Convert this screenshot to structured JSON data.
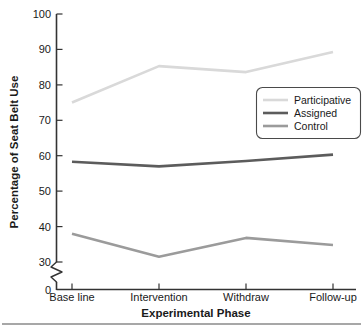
{
  "chart_data": {
    "type": "line",
    "title": "",
    "xlabel": "Experimental Phase",
    "ylabel": "Percentage of Seat Belt Use",
    "categories": [
      "Base line",
      "Intervention",
      "Withdraw",
      "Follow-up"
    ],
    "ylim": [
      30,
      100
    ],
    "yticks": [
      30,
      40,
      50,
      60,
      70,
      80,
      90,
      100
    ],
    "ytick_labels": [
      "30",
      "40",
      "50",
      "60",
      "70",
      "80",
      "90",
      "100"
    ],
    "y_origin_label": "0",
    "axis_break": true,
    "grid": false,
    "legend_position": "middle-right",
    "series": [
      {
        "name": "Participative",
        "color": "#d9d9d9",
        "values": [
          75.0,
          85.3,
          83.6,
          89.3
        ]
      },
      {
        "name": "Assigned",
        "color": "#5c5c5c",
        "values": [
          58.3,
          57.0,
          58.5,
          60.3
        ]
      },
      {
        "name": "Control",
        "color": "#9b9b9b",
        "values": [
          38.0,
          31.5,
          36.8,
          34.8
        ]
      }
    ]
  },
  "axes": {
    "y_title": "Percentage of Seat Belt Use",
    "x_title": "Experimental Phase"
  },
  "legend": {
    "entries": [
      {
        "label": "Participative",
        "color": "#d9d9d9"
      },
      {
        "label": "Assigned",
        "color": "#5c5c5c"
      },
      {
        "label": "Control",
        "color": "#9b9b9b"
      }
    ]
  }
}
